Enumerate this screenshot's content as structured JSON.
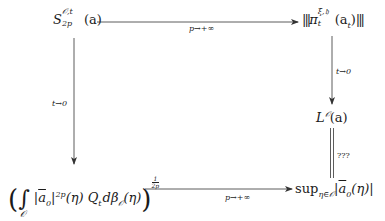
{
  "diagram": {
    "type": "commutative-diagram",
    "nodes": {
      "top_left": {
        "base": "S",
        "superscript": "𝒪,t",
        "subscript": "2p",
        "arg": "(a)"
      },
      "top_right": {
        "open": "|||",
        "base": "π",
        "superscript": "ξ,𝔥",
        "subscript": "t",
        "arg": "(a",
        "arg_sub": "t",
        "arg_close": ")",
        "close": "|||"
      },
      "mid_right": {
        "base": "L",
        "superscript": "𝒪",
        "arg": "(a)"
      },
      "bottom_left": {
        "open_paren": "(",
        "integral": "∫",
        "integral_domain": "𝒪",
        "abs_open": "|",
        "hat_term": "a",
        "hat_sub": "0",
        "abs_close": "|",
        "power": "2p",
        "arg": "(η) Q",
        "q_sub": "t",
        "measure": "dβ",
        "measure_sub": "𝒪",
        "measure_arg": "(η)",
        "close_paren": ")",
        "exp_num": "1",
        "exp_den": "2p"
      },
      "bottom_right": {
        "op": "sup",
        "op_sub": "η∈𝒪",
        "abs_open": "|",
        "hat_term": "a",
        "hat_sub": "0",
        "arg": "(η)",
        "abs_close": "|"
      }
    },
    "edges": {
      "top": {
        "label": "p→+∞",
        "from": "top_left",
        "to": "top_right",
        "style": "arrow"
      },
      "left": {
        "label": "t→0",
        "from": "top_left",
        "to": "bottom_left",
        "style": "arrow"
      },
      "right_upper": {
        "label": "t→0",
        "from": "top_right",
        "to": "mid_right",
        "style": "arrow"
      },
      "right_lower": {
        "label": "???",
        "from": "mid_right",
        "to": "bottom_right",
        "style": "double-line"
      },
      "bottom": {
        "label": "p→+∞",
        "from": "bottom_left",
        "to": "bottom_right",
        "style": "arrow"
      }
    },
    "colors": {
      "ink": "#1a1a1a",
      "arrow": "#333333"
    }
  }
}
